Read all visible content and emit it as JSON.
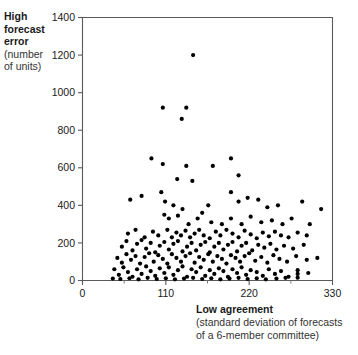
{
  "chart_data": {
    "type": "scatter",
    "title": "",
    "ylabel_bold": "High\nforecast\nerror",
    "ylabel_regular": "(number\nof units)",
    "xlabel_bold": "Low agreement",
    "xlabel_regular": "(standard deviation of forecasts\nof a 6-member committee)",
    "xlabel_line1": "Low agreement",
    "xlabel_line2": "(standard deviation of forecasts",
    "xlabel_line3": "of a 6-member committee)",
    "ylabel_line1": "High",
    "ylabel_line2": "forecast",
    "ylabel_line3": "error",
    "ylabel_line4": "(number",
    "ylabel_line5": "of units)",
    "xlim": [
      0,
      330
    ],
    "ylim": [
      0,
      1400
    ],
    "xticks": [
      0,
      110,
      220,
      330
    ],
    "yticks": [
      0,
      200,
      400,
      600,
      800,
      1000,
      1200,
      1400
    ],
    "xtick_labels": [
      "0",
      "110",
      "220",
      "330"
    ],
    "ytick_labels": [
      "0",
      "200",
      "400",
      "600",
      "800",
      "1000",
      "1200",
      "1400"
    ],
    "x_minor_ticks": [
      55,
      165,
      275
    ],
    "grid": false,
    "legend": false,
    "marker": "dot",
    "marker_color": "#000000",
    "marker_size": 2.1,
    "points": [
      [
        146,
        1200
      ],
      [
        106,
        920
      ],
      [
        137,
        920
      ],
      [
        131,
        860
      ],
      [
        91,
        650
      ],
      [
        106,
        620
      ],
      [
        137,
        610
      ],
      [
        172,
        610
      ],
      [
        196,
        650
      ],
      [
        206,
        560
      ],
      [
        125,
        540
      ],
      [
        145,
        530
      ],
      [
        63,
        430
      ],
      [
        78,
        450
      ],
      [
        104,
        470
      ],
      [
        109,
        420
      ],
      [
        120,
        400
      ],
      [
        132,
        380
      ],
      [
        158,
        360
      ],
      [
        166,
        400
      ],
      [
        196,
        470
      ],
      [
        206,
        420
      ],
      [
        218,
        440
      ],
      [
        232,
        430
      ],
      [
        244,
        390
      ],
      [
        258,
        400
      ],
      [
        290,
        420
      ],
      [
        315,
        380
      ],
      [
        108,
        350
      ],
      [
        114,
        330
      ],
      [
        126,
        345
      ],
      [
        140,
        300
      ],
      [
        152,
        330
      ],
      [
        170,
        310
      ],
      [
        184,
        300
      ],
      [
        196,
        330
      ],
      [
        210,
        300
      ],
      [
        222,
        340
      ],
      [
        236,
        310
      ],
      [
        250,
        320
      ],
      [
        264,
        300
      ],
      [
        276,
        330
      ],
      [
        300,
        300
      ],
      [
        60,
        250
      ],
      [
        70,
        270
      ],
      [
        82,
        230
      ],
      [
        93,
        260
      ],
      [
        100,
        240
      ],
      [
        112,
        270
      ],
      [
        118,
        230
      ],
      [
        124,
        255
      ],
      [
        130,
        240
      ],
      [
        136,
        265
      ],
      [
        142,
        230
      ],
      [
        148,
        250
      ],
      [
        154,
        270
      ],
      [
        160,
        240
      ],
      [
        168,
        225
      ],
      [
        176,
        260
      ],
      [
        182,
        240
      ],
      [
        190,
        270
      ],
      [
        198,
        250
      ],
      [
        206,
        230
      ],
      [
        214,
        265
      ],
      [
        222,
        245
      ],
      [
        230,
        225
      ],
      [
        238,
        255
      ],
      [
        246,
        235
      ],
      [
        254,
        260
      ],
      [
        262,
        240
      ],
      [
        272,
        230
      ],
      [
        284,
        255
      ],
      [
        296,
        240
      ],
      [
        52,
        180
      ],
      [
        58,
        210
      ],
      [
        66,
        160
      ],
      [
        72,
        195
      ],
      [
        78,
        215
      ],
      [
        84,
        170
      ],
      [
        90,
        200
      ],
      [
        96,
        150
      ],
      [
        102,
        185
      ],
      [
        108,
        205
      ],
      [
        114,
        165
      ],
      [
        120,
        195
      ],
      [
        126,
        210
      ],
      [
        132,
        155
      ],
      [
        138,
        180
      ],
      [
        144,
        200
      ],
      [
        150,
        160
      ],
      [
        156,
        190
      ],
      [
        162,
        205
      ],
      [
        168,
        150
      ],
      [
        174,
        180
      ],
      [
        180,
        200
      ],
      [
        186,
        165
      ],
      [
        192,
        190
      ],
      [
        198,
        205
      ],
      [
        204,
        155
      ],
      [
        210,
        185
      ],
      [
        216,
        200
      ],
      [
        224,
        160
      ],
      [
        232,
        190
      ],
      [
        240,
        175
      ],
      [
        248,
        195
      ],
      [
        256,
        165
      ],
      [
        266,
        185
      ],
      [
        278,
        170
      ],
      [
        292,
        190
      ],
      [
        46,
        120
      ],
      [
        52,
        95
      ],
      [
        58,
        140
      ],
      [
        64,
        110
      ],
      [
        70,
        130
      ],
      [
        76,
        90
      ],
      [
        82,
        125
      ],
      [
        88,
        145
      ],
      [
        94,
        100
      ],
      [
        100,
        135
      ],
      [
        106,
        115
      ],
      [
        112,
        90
      ],
      [
        118,
        140
      ],
      [
        124,
        120
      ],
      [
        130,
        100
      ],
      [
        136,
        130
      ],
      [
        142,
        145
      ],
      [
        148,
        95
      ],
      [
        154,
        125
      ],
      [
        160,
        110
      ],
      [
        166,
        140
      ],
      [
        172,
        100
      ],
      [
        178,
        130
      ],
      [
        184,
        115
      ],
      [
        190,
        90
      ],
      [
        196,
        135
      ],
      [
        202,
        120
      ],
      [
        208,
        100
      ],
      [
        214,
        130
      ],
      [
        220,
        145
      ],
      [
        228,
        105
      ],
      [
        236,
        125
      ],
      [
        244,
        95
      ],
      [
        252,
        135
      ],
      [
        260,
        115
      ],
      [
        270,
        100
      ],
      [
        282,
        130
      ],
      [
        296,
        110
      ],
      [
        310,
        120
      ],
      [
        42,
        60
      ],
      [
        48,
        30
      ],
      [
        54,
        70
      ],
      [
        60,
        45
      ],
      [
        66,
        20
      ],
      [
        72,
        60
      ],
      [
        78,
        35
      ],
      [
        84,
        75
      ],
      [
        90,
        50
      ],
      [
        96,
        25
      ],
      [
        102,
        65
      ],
      [
        108,
        40
      ],
      [
        114,
        70
      ],
      [
        120,
        30
      ],
      [
        126,
        55
      ],
      [
        132,
        75
      ],
      [
        138,
        20
      ],
      [
        144,
        60
      ],
      [
        150,
        45
      ],
      [
        156,
        70
      ],
      [
        162,
        25
      ],
      [
        168,
        55
      ],
      [
        174,
        35
      ],
      [
        180,
        65
      ],
      [
        186,
        50
      ],
      [
        192,
        20
      ],
      [
        198,
        60
      ],
      [
        204,
        40
      ],
      [
        210,
        70
      ],
      [
        216,
        30
      ],
      [
        222,
        55
      ],
      [
        230,
        45
      ],
      [
        238,
        25
      ],
      [
        246,
        60
      ],
      [
        254,
        35
      ],
      [
        262,
        50
      ],
      [
        272,
        20
      ],
      [
        284,
        55
      ],
      [
        284,
        35
      ],
      [
        284,
        15
      ],
      [
        298,
        40
      ],
      [
        40,
        10
      ],
      [
        50,
        8
      ],
      [
        62,
        12
      ],
      [
        74,
        6
      ],
      [
        86,
        14
      ],
      [
        98,
        8
      ],
      [
        110,
        12
      ],
      [
        122,
        6
      ],
      [
        134,
        10
      ],
      [
        146,
        14
      ],
      [
        158,
        8
      ],
      [
        170,
        12
      ],
      [
        182,
        6
      ],
      [
        194,
        10
      ],
      [
        206,
        14
      ],
      [
        218,
        8
      ],
      [
        230,
        12
      ],
      [
        242,
        6
      ],
      [
        256,
        10
      ],
      [
        268,
        14
      ]
    ]
  }
}
